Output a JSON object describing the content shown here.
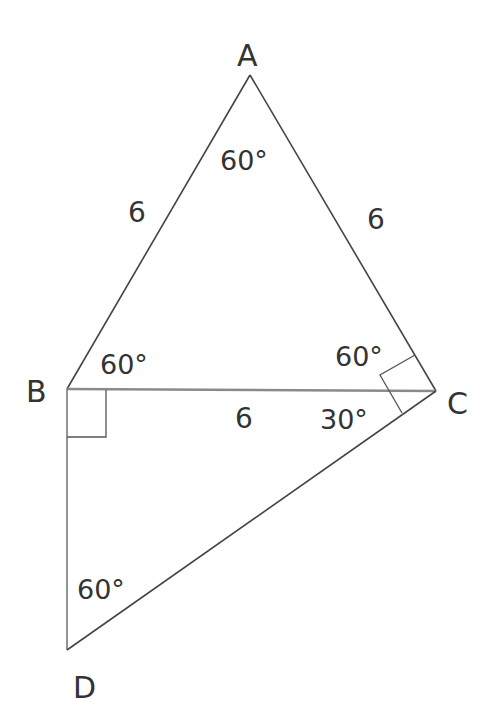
{
  "colors": {
    "line": "#444444",
    "base_line": "#8a8a8a",
    "text": "#333333",
    "background": "#ffffff"
  },
  "vertices": {
    "A": {
      "label": "A",
      "x": 250,
      "y": 75
    },
    "B": {
      "label": "B",
      "x": 67,
      "y": 389
    },
    "C": {
      "label": "C",
      "x": 436,
      "y": 391
    },
    "D": {
      "label": "D",
      "x": 67,
      "y": 650
    }
  },
  "segments": [
    {
      "name": "AB",
      "from": "A",
      "to": "B"
    },
    {
      "name": "AC",
      "from": "A",
      "to": "C"
    },
    {
      "name": "BC",
      "from": "B",
      "to": "C"
    },
    {
      "name": "BD",
      "from": "B",
      "to": "D"
    },
    {
      "name": "CD",
      "from": "C",
      "to": "D"
    }
  ],
  "side_labels": {
    "AB": "6",
    "AC": "6",
    "BC": "6"
  },
  "angle_labels": {
    "A": "60°",
    "B_ABC": "60°",
    "C_ACB": "60°",
    "C_BCD": "30°",
    "D": "60°"
  },
  "right_angles": [
    "B (between BC and BD)",
    "C (between CA and CD)"
  ]
}
